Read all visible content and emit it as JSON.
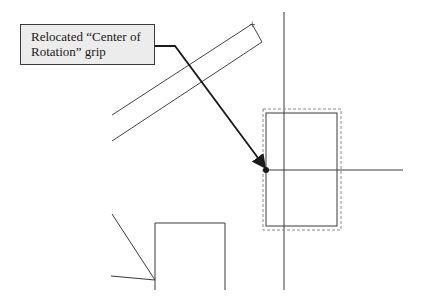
{
  "callout": {
    "text": "Relocated “Center of Rotation” grip"
  },
  "colors": {
    "background": "#ffffff",
    "callout_fill": "#ececec",
    "line": "#3a3a3a",
    "dashed": "#8a8a8a"
  }
}
